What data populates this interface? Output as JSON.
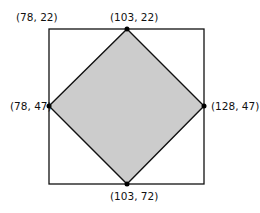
{
  "diagram": {
    "square": {
      "left": 49,
      "top": 29,
      "right": 204,
      "bottom": 184,
      "stroke": "#111111"
    },
    "diamond_fill": "#cccccc",
    "points": [
      {
        "id": "top-left-corner",
        "label": "(78, 22)"
      },
      {
        "id": "top",
        "label": "(103, 22)"
      },
      {
        "id": "left",
        "label": "(78, 47)"
      },
      {
        "id": "right",
        "label": "(128, 47)"
      },
      {
        "id": "bottom",
        "label": "(103, 72)"
      }
    ]
  }
}
